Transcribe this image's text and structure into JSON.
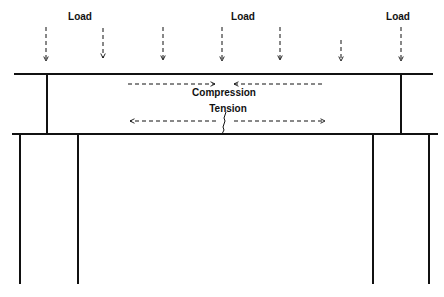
{
  "labels": {
    "load_left": "Load",
    "load_center": "Load",
    "load_right": "Load",
    "compression": "Compression",
    "tension": "Tension"
  },
  "load_arrows_x": [
    46,
    103,
    163,
    222,
    280,
    341,
    401
  ],
  "colors": {
    "line": "#111111",
    "background": "#ffffff"
  }
}
